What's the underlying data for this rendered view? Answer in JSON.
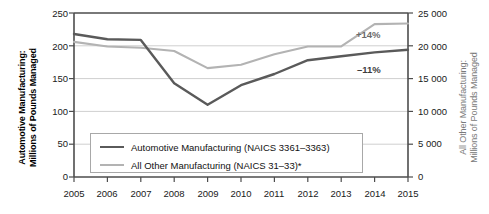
{
  "chart_data": {
    "type": "line",
    "title": "",
    "xlabel": "",
    "ylabel": "Automotive Manufacturing: Millions of Pounds Managed",
    "y2label": "All Other Manufacturing: Millions of Pounds Managed",
    "grid": true,
    "legend_position": "inside-bottom-left",
    "x": [
      2005,
      2006,
      2007,
      2008,
      2009,
      2010,
      2011,
      2012,
      2013,
      2014,
      2015
    ],
    "categories": [
      "2005",
      "2006",
      "2007",
      "2008",
      "2009",
      "2010",
      "2011",
      "2012",
      "2013",
      "2014",
      "2015"
    ],
    "ylim": [
      0,
      250
    ],
    "y2lim": [
      0,
      25000
    ],
    "yticks": [
      0,
      50,
      100,
      150,
      200,
      250
    ],
    "ytick_labels": [
      "0",
      "50",
      "100",
      "150",
      "200",
      "250"
    ],
    "y2ticks": [
      0,
      5000,
      10000,
      15000,
      20000,
      25000
    ],
    "y2tick_labels": [
      "0",
      "5 000",
      "10 000",
      "15 000",
      "20 000",
      "25 000"
    ],
    "series": [
      {
        "name": "Automotive Manufacturing (NAICS 3361–3363)",
        "axis": "left",
        "color": "#5a5a5a",
        "values": [
          218,
          210,
          209,
          143,
          110,
          140,
          157,
          178,
          184,
          190,
          194
        ]
      },
      {
        "name": "All Other Manufacturing (NAICS 31–33)*",
        "axis": "right",
        "color": "#b3b3b3",
        "values": [
          20600,
          19900,
          19700,
          19200,
          16600,
          17100,
          18700,
          19900,
          19900,
          23300,
          23400
        ]
      }
    ],
    "annotations": [
      {
        "text": "+14%",
        "series": "All Other Manufacturing (NAICS 31–33)*",
        "color": "#6b6b6b"
      },
      {
        "text": "–11%",
        "series": "Automotive Manufacturing (NAICS 3361–3363)",
        "color": "#3d3d3d"
      }
    ]
  },
  "axis_titles": {
    "left_line1": "Automotive Manufacturing:",
    "left_line2": "Millions of Pounds Managed",
    "right_line1": "All Other Manufacturing:",
    "right_line2": "Millions of Pounds Managed"
  },
  "y_left": {
    "t0": "0",
    "t1": "50",
    "t2": "100",
    "t3": "150",
    "t4": "200",
    "t5": "250"
  },
  "y_right": {
    "t0": "0",
    "t1": "5 000",
    "t2": "10 000",
    "t3": "15 000",
    "t4": "20 000",
    "t5": "25 000"
  },
  "x_axis": {
    "t0": "2005",
    "t1": "2006",
    "t2": "2007",
    "t3": "2008",
    "t4": "2009",
    "t5": "2010",
    "t6": "2011",
    "t7": "2012",
    "t8": "2013",
    "t9": "2014",
    "t10": "2015"
  },
  "legend": {
    "item1": "Automotive Manufacturing (NAICS 3361–3363)",
    "item2": "All Other Manufacturing (NAICS 31–33)*"
  },
  "annotations": {
    "all_other_change": "+14%",
    "automotive_change": "–11%"
  },
  "colors": {
    "automotive_line": "#5a5a5a",
    "all_other_line": "#b3b3b3",
    "grid": "#cfcfcf",
    "axis": "#4d4d4d",
    "text": "#111111"
  }
}
